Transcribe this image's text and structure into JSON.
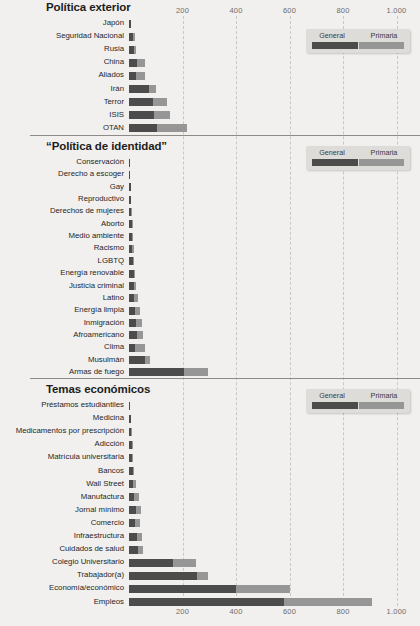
{
  "legend": {
    "general": "General",
    "primaria": "Primaria"
  },
  "axis": {
    "ticks": [
      "200",
      "400",
      "600",
      "800",
      "1.000"
    ],
    "tick_values": [
      200,
      400,
      600,
      800,
      1000
    ],
    "min": 0,
    "max": 1000
  },
  "sections": [
    {
      "title": "Política exterior"
    },
    {
      "title": "“Política de identidad”"
    },
    {
      "title": "Temas económicos"
    }
  ],
  "chart_data": {
    "type": "bar",
    "orientation": "horizontal",
    "stacked": true,
    "title": "",
    "xlabel": "",
    "ylabel": "",
    "xlim": [
      0,
      1000
    ],
    "grid": true,
    "legend_position": "top-right",
    "series": [
      {
        "name": "General",
        "color": "#4c4c4c"
      },
      {
        "name": "Primaria",
        "color": "#969696"
      }
    ],
    "panels": [
      {
        "title": "Política exterior",
        "categories": [
          "Japón",
          "Seguridad Nacional",
          "Rusia",
          "China",
          "Aliados",
          "Irán",
          "Terror",
          "ISIS",
          "OTAN"
        ],
        "general": [
          8,
          14,
          20,
          30,
          28,
          74,
          88,
          95,
          105
        ],
        "primaria": [
          0,
          10,
          6,
          30,
          30,
          26,
          54,
          58,
          113
        ]
      },
      {
        "title": "“Política de identidad”",
        "categories": [
          "Conservación",
          "Derecho a escoger",
          "Gay",
          "Reproductivo",
          "Derechos de mujeres",
          "Aborto",
          "Medio ambiente",
          "Racismo",
          "LGBTQ",
          "Energía renovable",
          "Justicia criminal",
          "Latino",
          "Energía limpia",
          "Inmigración",
          "Afroamericano",
          "Clima",
          "Musulmán",
          "Armas de fuego"
        ],
        "general": [
          3,
          5,
          6,
          7,
          9,
          11,
          11,
          13,
          14,
          18,
          18,
          20,
          22,
          25,
          29,
          23,
          60,
          207
        ],
        "primaria": [
          0,
          0,
          0,
          0,
          1,
          1,
          2,
          5,
          3,
          4,
          9,
          15,
          20,
          23,
          22,
          37,
          18,
          88
        ]
      },
      {
        "title": "Temas económicos",
        "categories": [
          "Préstamos estudiantiles",
          "Medicina",
          "Medicamentos por prescripción",
          "Adicción",
          "Matrícula universitaria",
          "Bancos",
          "Wall Street",
          "Manufactura",
          "Jornal mínimo",
          "Comercio",
          "Infraestructura",
          "Cuidados de salud",
          "Colegio Universitario",
          "Trabajador(a)",
          "Economía/económico",
          "Empleos"
        ],
        "general": [
          5,
          6,
          9,
          10,
          12,
          14,
          16,
          20,
          28,
          24,
          30,
          33,
          165,
          255,
          400,
          580
        ],
        "primaria": [
          0,
          0,
          1,
          1,
          4,
          5,
          12,
          18,
          16,
          16,
          19,
          21,
          85,
          40,
          200,
          330
        ]
      }
    ]
  }
}
